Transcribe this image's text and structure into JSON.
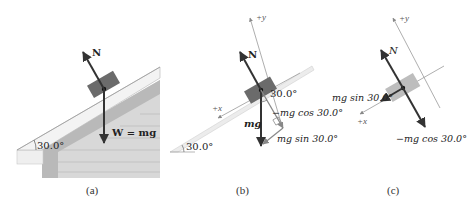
{
  "figure": {
    "panels": [
      {
        "id": "a",
        "caption": "(a)",
        "description": "Box resting on an inclined roof of a house",
        "angle_label": "30.0°",
        "vectors": {
          "normal": "N",
          "weight": "W = mg"
        }
      },
      {
        "id": "b",
        "caption": "(b)",
        "description": "Free-body diagram with tilted axes and weight components",
        "axis_x": "+x",
        "axis_y": "+y",
        "angle_label_incline": "30.0°",
        "angle_label_weight": "30.0°",
        "vectors": {
          "normal": "N",
          "weight": "mg",
          "perp_component": "−mg cos 30.0°",
          "parallel_component": "mg sin 30.0°"
        }
      },
      {
        "id": "c",
        "caption": "(c)",
        "description": "Forces resolved along rotated axes",
        "axis_x": "+x",
        "axis_y": "+y",
        "vectors": {
          "normal": "N",
          "parallel_component": "mg sin 30.0°",
          "perp_component": "−mg cos 30.0°"
        }
      }
    ],
    "colors": {
      "box_dark": "#6b6b6b",
      "box_light": "#bdbdbd",
      "roof_light": "#f2f2f2",
      "wall": "#d6d6d6",
      "wall_stripe": "#c4c4c4",
      "arrow": "#333333",
      "axis_line": "#9a9a9a"
    }
  }
}
